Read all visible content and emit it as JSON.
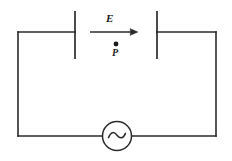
{
  "figure": {
    "type": "circuit-diagram",
    "width": 232,
    "height": 161,
    "background_color": "#ffffff",
    "line_color": "#2b2b2b",
    "line_width": 1.6
  },
  "labels": {
    "field_vector": "E",
    "point": "P"
  },
  "components": {
    "capacitor": {
      "name": "parallel-plate-capacitor",
      "left_plate": {
        "x": 75,
        "y_top": 11,
        "y_bottom": 59
      },
      "right_plate": {
        "x": 157,
        "y_top": 11,
        "y_bottom": 59
      }
    },
    "ac_source": {
      "name": "ac-voltage-source",
      "symbol": "~",
      "center_x": 117,
      "center_y": 136,
      "radius": 14.5
    },
    "field_arrow": {
      "name": "electric-field-arrow",
      "x_start": 90,
      "x_end": 138,
      "y": 32,
      "direction": "right"
    },
    "point_marker": {
      "name": "point-p-marker",
      "x": 116,
      "y": 44,
      "radius": 2.4
    },
    "wires": {
      "top_left_corner": {
        "x": 18,
        "y": 32
      },
      "top_right_corner": {
        "x": 216,
        "y": 32
      },
      "bottom_left_corner": {
        "x": 18,
        "y": 136
      },
      "bottom_right_corner": {
        "x": 216,
        "y": 136
      }
    }
  }
}
